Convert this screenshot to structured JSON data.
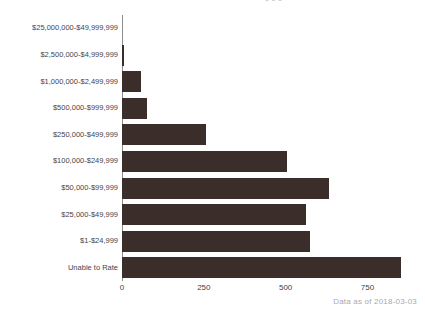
{
  "chart_data": {
    "type": "bar",
    "orientation": "horizontal",
    "title": "",
    "xlabel": "",
    "ylabel": "",
    "grid": false,
    "legend": null,
    "xlim": [
      0,
      880
    ],
    "xticks": [
      "0",
      "250",
      "500",
      "750"
    ],
    "xtick_values": [
      0,
      250,
      500,
      750
    ],
    "categories": [
      "$25,000,000-$49,999,999",
      "$2,500,000-$4,999,999",
      "$1,000,000-$2,499,999",
      "$500,000-$999,999",
      "$250,000-$499,999",
      "$100,000-$249,999",
      "$50,000-$99,999",
      "$25,000-$49,999",
      "$1-$24,999",
      "Unable to Rate"
    ],
    "values": [
      0,
      6,
      58,
      76,
      256,
      503,
      634,
      561,
      573,
      851
    ],
    "bar_color": "#3a2d2a",
    "axis_color": "#8d8d8d"
  },
  "header": {
    "clipped_title_fragment": "o   o                    o"
  },
  "footer": {
    "note": "Data as of 2018-03-03"
  }
}
